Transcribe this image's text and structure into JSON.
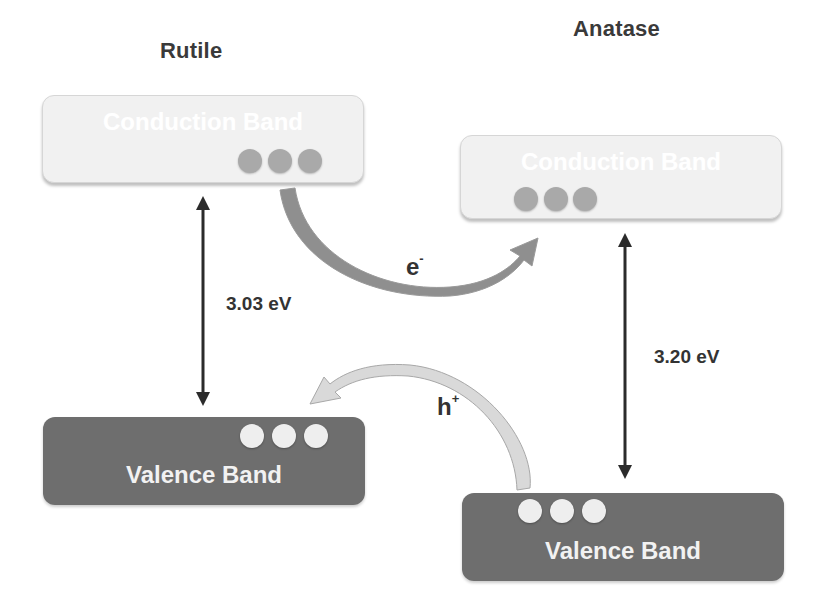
{
  "phases": {
    "rutile": {
      "title": "Rutile",
      "conduction_band": {
        "label": "Conduction Band",
        "electrons": 3
      },
      "valence_band": {
        "label": "Valence Band",
        "holes": 3
      },
      "band_gap": "3.03 eV"
    },
    "anatase": {
      "title": "Anatase",
      "conduction_band": {
        "label": "Conduction Band",
        "electrons": 3
      },
      "valence_band": {
        "label": "Valence Band",
        "holes": 3
      },
      "band_gap": "3.20 eV"
    }
  },
  "transfers": {
    "electron": {
      "symbol": "e",
      "charge": "-",
      "direction": "Rutile CB → Anatase CB"
    },
    "hole": {
      "symbol": "h",
      "charge": "+",
      "direction": "Anatase VB → Rutile VB"
    }
  },
  "colors": {
    "conduction_band_fill": "#f1f1f1",
    "valence_band_fill": "#6e6e6e",
    "electron_dot": "#a9a9a9",
    "hole_dot": "#eeeeee",
    "electron_arrow": "#8c8c8c",
    "hole_arrow": "#d4d4d4",
    "text": "#333333"
  }
}
